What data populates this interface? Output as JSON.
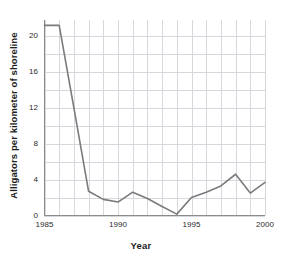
{
  "chart_data": {
    "type": "line",
    "title": "",
    "xlabel": "Year",
    "ylabel": "Alligators per kilometer of shoreline",
    "x": [
      1985,
      1986,
      1987,
      1988,
      1989,
      1990,
      1991,
      1992,
      1993,
      1994,
      1995,
      1996,
      1997,
      1998,
      1999,
      2000
    ],
    "values": [
      21.2,
      21.2,
      12.0,
      2.7,
      1.8,
      1.5,
      2.6,
      1.9,
      1.0,
      0.15,
      2.0,
      2.6,
      3.3,
      4.6,
      2.5,
      3.7
    ],
    "series": [
      {
        "name": "Alligators per kilometer of shoreline",
        "values": [
          21.2,
          21.2,
          12.0,
          2.7,
          1.8,
          1.5,
          2.6,
          1.9,
          1.0,
          0.15,
          2.0,
          2.6,
          3.3,
          4.6,
          2.5,
          3.7
        ]
      }
    ],
    "xlim": [
      1985,
      2000
    ],
    "ylim": [
      0,
      21.8
    ],
    "xticks": [
      1985,
      1990,
      1995,
      2000
    ],
    "xtick_labels": [
      "1985",
      "1990",
      "1995",
      "2000"
    ],
    "yticks": [
      0,
      4,
      8,
      12,
      16,
      20
    ],
    "ytick_labels": [
      "0",
      "4",
      "8",
      "12",
      "16",
      "20"
    ],
    "grid": true,
    "grid_minor_y_step": 2,
    "grid_minor_x_step": 1,
    "legend": "none",
    "line_color": "#7b7b7b",
    "grid_color": "#d5d9de",
    "axis_color": "#8a8a8a",
    "background": "#ffffff"
  }
}
